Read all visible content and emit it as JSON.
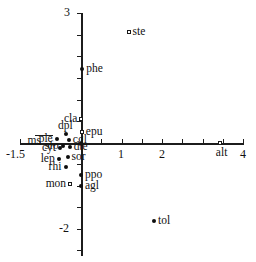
{
  "chart_data": {
    "type": "scatter",
    "title": "",
    "subtitle": "",
    "xlabel": "",
    "ylabel": "",
    "xlim": [
      -1.5,
      4
    ],
    "ylim": [
      -3,
      3
    ],
    "grid": false,
    "legend": null,
    "x_ticks": [
      -1.5,
      1,
      2,
      4
    ],
    "x_tick_labels": [
      "-1.5",
      "1",
      "2",
      "4"
    ],
    "y_ticks": [
      3,
      -2
    ],
    "y_tick_labels": [
      "3",
      "-2"
    ],
    "axis_origin": [
      0,
      0
    ],
    "marker_types": [
      "filled-circle",
      "open-square"
    ],
    "points": [
      {
        "label": "ste",
        "x": 1.17,
        "y": 2.57,
        "marker": "open-square",
        "label_pos": "right"
      },
      {
        "label": "phe",
        "x": 0.03,
        "y": 1.72,
        "marker": "filled-circle",
        "label_pos": "right"
      },
      {
        "label": "cla",
        "x": 0.0,
        "y": 0.55,
        "marker": "open-square",
        "label_pos": "left"
      },
      {
        "label": "epu",
        "x": 0.02,
        "y": 0.25,
        "marker": "open-square",
        "label_pos": "right"
      },
      {
        "label": "dpl",
        "x": -0.38,
        "y": 0.2,
        "marker": "filled-circle",
        "label_pos": "above"
      },
      {
        "label": "ple",
        "x": -0.6,
        "y": 0.1,
        "marker": "filled-circle",
        "label_pos": "left"
      },
      {
        "label": "cgl",
        "x": -0.3,
        "y": 0.08,
        "marker": "filled-circle",
        "label_pos": "right"
      },
      {
        "label": "ms",
        "x": -0.9,
        "y": 0.05,
        "marker": "leader",
        "label_pos": "left"
      },
      {
        "label": "sfo",
        "x": -0.45,
        "y": -0.08,
        "marker": "filled-circle",
        "label_pos": "left"
      },
      {
        "label": "dte",
        "x": -0.28,
        "y": -0.1,
        "marker": "filled-circle",
        "label_pos": "right"
      },
      {
        "label": "cyt",
        "x": -0.52,
        "y": -0.12,
        "marker": "filled-circle",
        "label_pos": "left"
      },
      {
        "label": "sor",
        "x": -0.33,
        "y": -0.33,
        "marker": "filled-circle",
        "label_pos": "right"
      },
      {
        "label": "lep",
        "x": -0.55,
        "y": -0.38,
        "marker": "filled-circle",
        "label_pos": "left"
      },
      {
        "label": "rhi",
        "x": -0.38,
        "y": -0.55,
        "marker": "filled-circle",
        "label_pos": "left"
      },
      {
        "label": "ppo",
        "x": 0.0,
        "y": -0.75,
        "marker": "filled-circle",
        "label_pos": "right"
      },
      {
        "label": "mon",
        "x": -0.28,
        "y": -0.95,
        "marker": "open-square",
        "label_pos": "left"
      },
      {
        "label": "agl",
        "x": 0.0,
        "y": -1.0,
        "marker": "filled-circle",
        "label_pos": "right"
      },
      {
        "label": "alt",
        "x": 3.42,
        "y": 0.0,
        "marker": "open-square",
        "label_pos": "below"
      },
      {
        "label": "tol",
        "x": 1.8,
        "y": -1.8,
        "marker": "filled-circle",
        "label_pos": "right"
      }
    ]
  },
  "colors": {
    "axis": "#1c1c1c",
    "marker_fill": "#0d0d0d",
    "marker_open_stroke": "#1a1a1a",
    "text": "#111111",
    "background": "#ffffff"
  }
}
